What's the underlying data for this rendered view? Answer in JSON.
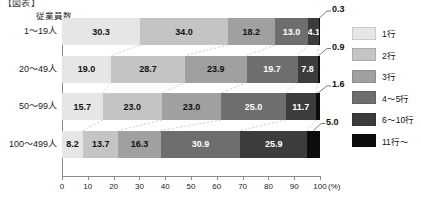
{
  "caption": "【図表】",
  "axis_title": "従業員数",
  "legend": {
    "items": [
      {
        "label": "1行",
        "color": "#e6e6e6"
      },
      {
        "label": "2行",
        "color": "#c4c4c4"
      },
      {
        "label": "3行",
        "color": "#a0a0a0"
      },
      {
        "label": "4〜5行",
        "color": "#6e6e6e"
      },
      {
        "label": "6〜10行",
        "color": "#3c3c3c"
      },
      {
        "label": "11行〜",
        "color": "#0d0d0d"
      }
    ]
  },
  "chart_data": {
    "type": "bar",
    "orientation": "horizontal",
    "stacked": true,
    "normalized_percent": true,
    "title": "",
    "xlabel": "(%)",
    "ylabel": "従業員数",
    "xlim": [
      0,
      100
    ],
    "xticks": [
      0,
      10,
      20,
      30,
      40,
      50,
      60,
      70,
      80,
      90,
      100
    ],
    "xticklabels": [
      "0",
      "10",
      "20",
      "30",
      "40",
      "50",
      "60",
      "70",
      "80",
      "90",
      "100"
    ],
    "grid": false,
    "legend_position": "right",
    "categories": [
      "1〜19人",
      "20〜49人",
      "50〜99人",
      "100〜499人"
    ],
    "series": [
      {
        "name": "1行",
        "color": "#e6e6e6",
        "values": [
          30.3,
          19.0,
          15.7,
          8.2
        ]
      },
      {
        "name": "2行",
        "color": "#c4c4c4",
        "values": [
          34.0,
          28.7,
          23.0,
          13.7
        ]
      },
      {
        "name": "3行",
        "color": "#a0a0a0",
        "values": [
          18.2,
          23.9,
          23.0,
          16.3
        ]
      },
      {
        "name": "4〜5行",
        "color": "#6e6e6e",
        "values": [
          13.0,
          19.7,
          25.0,
          30.9
        ]
      },
      {
        "name": "6〜10行",
        "color": "#3c3c3c",
        "values": [
          4.1,
          7.8,
          11.7,
          25.9
        ]
      },
      {
        "name": "11行〜",
        "color": "#0d0d0d",
        "values": [
          0.3,
          0.9,
          1.6,
          5.0
        ]
      }
    ],
    "callout_values": [
      "0.3",
      "0.9",
      "1.6",
      "5.0"
    ]
  }
}
